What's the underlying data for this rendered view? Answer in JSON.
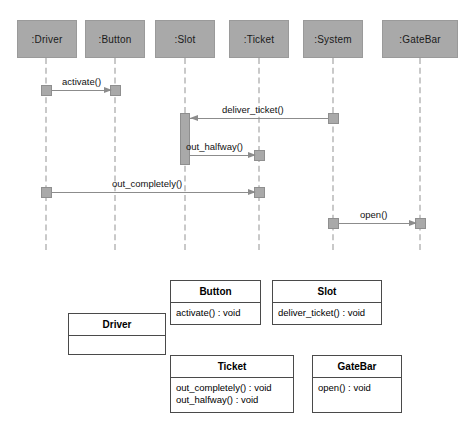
{
  "diagram": {
    "type": "uml-sequence-and-class-diagram",
    "background_color": "#ffffff",
    "header_fill_color": "#a9a9a9",
    "lifeline_color": "#c9c9c9",
    "message_color": "#8c8c8c",
    "class_border_color": "#4a4a4a"
  },
  "sequence": {
    "lifelines": [
      {
        "label": ":Driver",
        "x": 46,
        "head_left": 17,
        "head_width": 60
      },
      {
        "label": ":Button",
        "x": 115,
        "head_left": 85,
        "head_width": 60
      },
      {
        "label": ":Slot",
        "x": 185,
        "head_left": 155,
        "head_width": 60
      },
      {
        "label": ":Ticket",
        "x": 259,
        "head_left": 229,
        "head_width": 60
      },
      {
        "label": ":System",
        "x": 333,
        "head_left": 303,
        "head_width": 60
      },
      {
        "label": ":GateBar",
        "x": 420,
        "head_left": 382,
        "head_width": 76
      }
    ],
    "messages": [
      {
        "label": "activate()",
        "from": ":Driver",
        "to": ":Button",
        "direction": "right",
        "y": 90
      },
      {
        "label": "deliver_ticket()",
        "from": ":System",
        "to": ":Slot",
        "direction": "left",
        "y": 118
      },
      {
        "label": "out_halfway()",
        "from": ":Slot",
        "to": ":Ticket",
        "direction": "right",
        "y": 155
      },
      {
        "label": "out_completely()",
        "from": ":Driver",
        "to": ":Ticket",
        "direction": "right",
        "y": 192
      },
      {
        "label": "open()",
        "from": ":System",
        "to": ":GateBar",
        "direction": "right",
        "y": 223
      }
    ]
  },
  "classes": [
    {
      "name": "Driver",
      "operations": [],
      "x": 68,
      "y": 313,
      "width": 98,
      "height": 42
    },
    {
      "name": "Button",
      "operations": [
        "activate() : void"
      ],
      "x": 170,
      "y": 280,
      "width": 91,
      "height": 45
    },
    {
      "name": "Slot",
      "operations": [
        "deliver_ticket() : void"
      ],
      "x": 272,
      "y": 280,
      "width": 110,
      "height": 45
    },
    {
      "name": "Ticket",
      "operations": [
        "out_completely() : void",
        "out_halfway() : void"
      ],
      "x": 170,
      "y": 355,
      "width": 124,
      "height": 58
    },
    {
      "name": "GateBar",
      "operations": [
        "open() : void"
      ],
      "x": 312,
      "y": 355,
      "width": 90,
      "height": 58
    }
  ]
}
